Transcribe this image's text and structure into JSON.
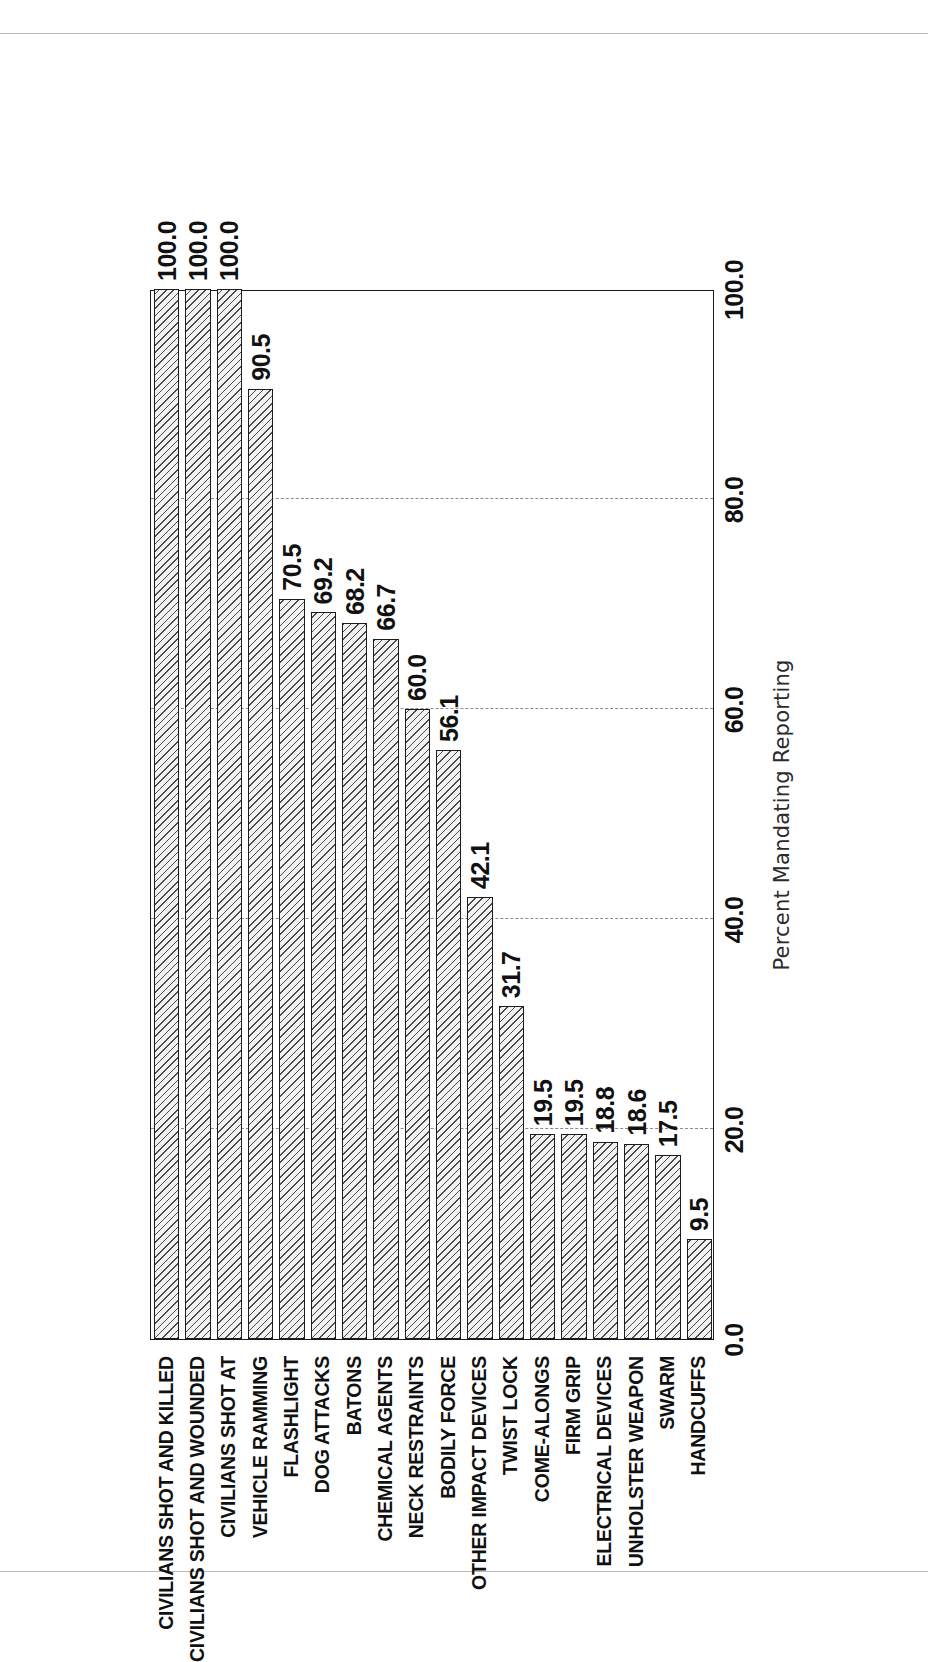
{
  "chart_data": {
    "type": "bar",
    "orientation": "horizontal",
    "title": "",
    "xlabel": "Percent Mandating Reporting",
    "ylabel": "",
    "xlim": [
      0.0,
      100.0
    ],
    "xticks": [
      "0.0",
      "20.0",
      "40.0",
      "60.0",
      "80.0",
      "100.0"
    ],
    "xtick_values": [
      0.0,
      20.0,
      40.0,
      60.0,
      80.0,
      100.0
    ],
    "grid": "dashed vertical gridlines at 20.0, 40.0, 60.0, 80.0",
    "gridlines": [
      20.0,
      40.0,
      60.0,
      80.0
    ],
    "legend": "none",
    "bar_style": {
      "fill": "#f2f2f2",
      "hatch": "diagonal-45",
      "edge": "#1c1c1c"
    },
    "categories": [
      "CIVILIANS SHOT AND KILLED",
      "CIVILIANS SHOT AND WOUNDED",
      "CIVILIANS SHOT AT",
      "VEHICLE RAMMING",
      "FLASHLIGHT",
      "DOG ATTACKS",
      "BATONS",
      "CHEMICAL AGENTS",
      "NECK RESTRAINTS",
      "BODILY FORCE",
      "OTHER IMPACT DEVICES",
      "TWIST LOCK",
      "COME-ALONGS",
      "FIRM GRIP",
      "ELECTRICAL DEVICES",
      "UNHOLSTER WEAPON",
      "SWARM",
      "HANDCUFFS"
    ],
    "values": [
      100.0,
      100.0,
      100.0,
      90.5,
      70.5,
      69.2,
      68.2,
      66.7,
      60.0,
      56.1,
      42.1,
      31.7,
      19.5,
      19.5,
      18.8,
      18.6,
      17.5,
      9.5
    ],
    "value_labels": [
      "100.0",
      "100.0",
      "100.0",
      "90.5",
      "70.5",
      "69.2",
      "68.2",
      "66.7",
      "60.0",
      "56.1",
      "42.1",
      "31.7",
      "19.5",
      "19.5",
      "18.8",
      "18.6",
      "17.5",
      "9.5"
    ]
  }
}
